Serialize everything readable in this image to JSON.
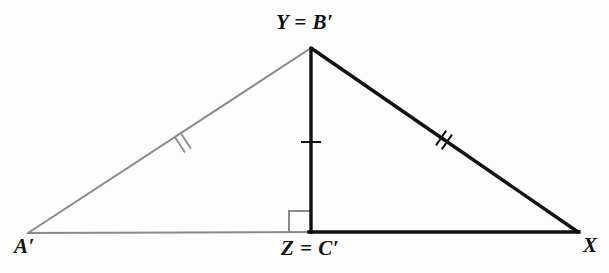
{
  "figure": {
    "type": "geometry-diagram",
    "background_color": "#fdfdfd",
    "grey_color": "#8a8a8a",
    "black_color": "#111111"
  },
  "labels": {
    "apex": "Y = B′",
    "left_vertex": "A′",
    "foot": "Z = C′",
    "right_vertex": "X"
  },
  "points": {
    "apex": {
      "x": 311,
      "y": 47
    },
    "left_vertex": {
      "x": 28,
      "y": 233
    },
    "right_vertex": {
      "x": 578,
      "y": 232
    },
    "foot": {
      "x": 311,
      "y": 232
    }
  },
  "segments": [
    {
      "name": "left-leg",
      "from": "left_vertex",
      "to": "apex",
      "color": "#8a8a8a",
      "width": 2.0,
      "ticks": 2
    },
    {
      "name": "right-leg",
      "from": "apex",
      "to": "right_vertex",
      "color": "#111111",
      "width": 3.4,
      "ticks": 2
    },
    {
      "name": "base-left",
      "from": "left_vertex",
      "to": "foot",
      "color": "#8a8a8a",
      "width": 2.0,
      "ticks": 0
    },
    {
      "name": "base-right",
      "from": "foot",
      "to": "right_vertex",
      "color": "#111111",
      "width": 3.4,
      "ticks": 0
    },
    {
      "name": "altitude",
      "from": "apex",
      "to": "foot",
      "color": "#111111",
      "width": 3.4,
      "ticks": 1
    }
  ],
  "tick_marks": {
    "left_leg_count": 2,
    "right_leg_count": 2,
    "altitude_count": 1,
    "left_leg_position": {
      "x": 183,
      "y": 143
    },
    "right_leg_position": {
      "x": 444,
      "y": 140
    },
    "altitude_position": {
      "x": 311,
      "y": 142
    }
  },
  "right_angle_marker": {
    "vertex": "foot",
    "size": 22,
    "side": "left",
    "color": "#8a8a8a"
  }
}
